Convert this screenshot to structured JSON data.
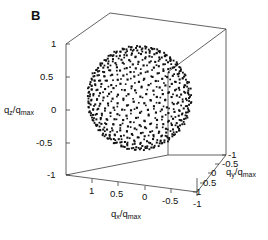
{
  "figure": {
    "panel_label": "B",
    "background_color": "#ffffff",
    "line_color": "#3a3a3a",
    "marker_color": "#111111"
  },
  "axes": {
    "z": {
      "label_main": "q",
      "label_sub": "z",
      "label_denom_main": "q",
      "label_denom_sub": "max",
      "label_full": "qz/qmax",
      "ticks": [
        "1",
        "0.5",
        "0",
        "-0.5",
        "-1"
      ],
      "range": [
        -1,
        1
      ]
    },
    "x": {
      "label_main": "q",
      "label_sub": "x",
      "label_denom_main": "q",
      "label_denom_sub": "max",
      "label_full": "qx/qmax",
      "ticks": [
        "1",
        "0.5",
        "0",
        "-0.5",
        "-1"
      ],
      "range": [
        -1,
        1
      ]
    },
    "y": {
      "label_main": "q",
      "label_sub": "y",
      "label_denom_main": "q",
      "label_denom_sub": "max",
      "label_full": "qy/qmax",
      "ticks": [
        "-1",
        "-0.5",
        "0",
        "0.5",
        "1"
      ],
      "range": [
        -1,
        1
      ]
    }
  },
  "chart_data": {
    "type": "scatter",
    "title": "B",
    "subtitle": "",
    "xlabel": "qx/qmax",
    "ylabel": "qy/qmax",
    "zlabel": "qz/qmax",
    "xlim": [
      -1,
      1
    ],
    "ylim": [
      -1,
      1
    ],
    "zlim": [
      -1,
      1
    ],
    "xticks": [
      "1",
      "0.5",
      "0",
      "-0.5",
      "-1"
    ],
    "yticks": [
      "-1",
      "-0.5",
      "0",
      "0.5",
      "1"
    ],
    "zticks": [
      "1",
      "0.5",
      "0",
      "-0.5",
      "-1"
    ],
    "grid": false,
    "legend": false,
    "projection": "3d-box",
    "shell_radius": 1.0,
    "n_points": 620,
    "marker": "square",
    "marker_size_px": 2,
    "series": [
      {
        "name": "q-space sphere shell",
        "radius": 1.0,
        "values": []
      }
    ]
  }
}
